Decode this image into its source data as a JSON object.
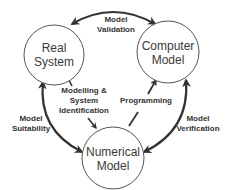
{
  "colors": {
    "background": "#ffffff",
    "circle_stroke": "#555555",
    "arrow": "#333333",
    "text": "#333333"
  },
  "nodes": [
    {
      "id": "real-system",
      "line1": "Real",
      "line2": "System"
    },
    {
      "id": "computer-model",
      "line1": "Computer",
      "line2": "Model"
    },
    {
      "id": "numerical-model",
      "line1": "Numerical",
      "line2": "Model"
    }
  ],
  "edges": [
    {
      "id": "model-validation",
      "line1": "Model",
      "line2": "Validation",
      "from": "Real System",
      "to": "Computer Model",
      "bidirectional": true
    },
    {
      "id": "modelling",
      "line1": "Modelling &",
      "line2": "System",
      "line3": "Identification",
      "from": "Real System",
      "to": "Numerical Model",
      "bidirectional": false
    },
    {
      "id": "programming",
      "line1": "Programming",
      "from": "Numerical Model",
      "to": "Computer Model",
      "bidirectional": false
    },
    {
      "id": "model-suitability",
      "line1": "Model",
      "line2": "Suitability",
      "from": "Numerical Model",
      "to": "Real System",
      "bidirectional": true
    },
    {
      "id": "model-verification",
      "line1": "Model",
      "line2": "Verification",
      "from": "Computer Model",
      "to": "Numerical Model",
      "bidirectional": true
    }
  ]
}
